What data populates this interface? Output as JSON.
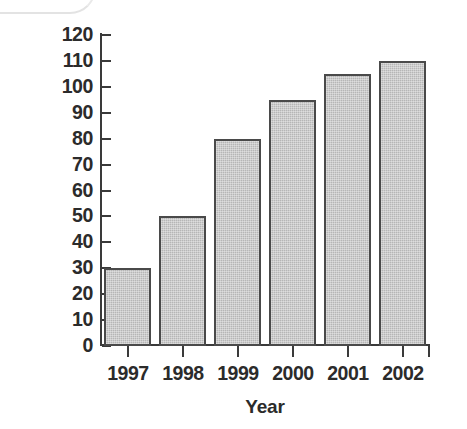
{
  "chart_data": {
    "type": "bar",
    "title": "",
    "xlabel": "Year",
    "ylabel": "Sales volume ('000 units)",
    "categories": [
      "1997",
      "1998",
      "1999",
      "2000",
      "2001",
      "2002"
    ],
    "values": [
      30,
      50,
      80,
      95,
      105,
      110
    ],
    "series": [
      {
        "name": "Sales volume",
        "values": [
          30,
          50,
          80,
          95,
          105,
          110
        ]
      }
    ],
    "ylim": [
      0,
      120
    ],
    "ytick_step": 10,
    "ytick_labels": [
      "0",
      "10",
      "20",
      "30",
      "40",
      "50",
      "60",
      "70",
      "80",
      "90",
      "100",
      "110",
      "120"
    ],
    "ytick_values": [
      0,
      10,
      20,
      30,
      40,
      50,
      60,
      70,
      80,
      90,
      100,
      110,
      120
    ],
    "xtick_labels": [
      "1997",
      "1998",
      "1999",
      "2000",
      "2001",
      "2002"
    ],
    "grid": false,
    "legend": "none",
    "bar_fill_color": "#b6b6b6",
    "bar_border_color": "#4a4a4a",
    "axis_color": "#3a3a3a",
    "text_color": "#2b2b2b",
    "background_color": "#ffffff"
  }
}
